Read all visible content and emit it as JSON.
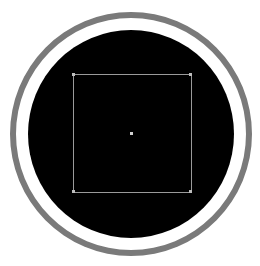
{
  "view": {
    "type": "circular-viewport",
    "colors": {
      "background": "#ffffff",
      "ring": "#7a7a7a",
      "disc": "#000000",
      "frame": "#9a9a9a",
      "center_dot": "#d0d0d0"
    },
    "elements": [
      "outer-ring",
      "black-disc",
      "square-frame",
      "center-dot"
    ]
  }
}
